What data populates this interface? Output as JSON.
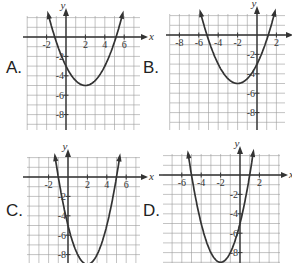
{
  "options": [
    {
      "label": "A.",
      "x_ticks": [
        "-2",
        "2",
        "4",
        "6"
      ],
      "y_ticks": [
        "-2",
        "-4",
        "-6",
        "-8"
      ],
      "equation_estimate": "y = 0.5(x-2)^2 - 5",
      "vertex": [
        2,
        -5
      ]
    },
    {
      "label": "B.",
      "x_ticks": [
        "-8",
        "-6",
        "-4",
        "-2",
        "2"
      ],
      "y_ticks": [
        "-2",
        "-4",
        "-6",
        "-8"
      ],
      "equation_estimate": "y = 0.5(x+2)^2 - 5",
      "vertex": [
        -2,
        -5
      ]
    },
    {
      "label": "C.",
      "x_ticks": [
        "-2",
        "2",
        "4",
        "6"
      ],
      "y_ticks": [
        "-2",
        "-4",
        "-6",
        "-8"
      ],
      "equation_estimate": "y = (x-2)^2 - 9",
      "vertex": [
        2,
        -9
      ]
    },
    {
      "label": "D.",
      "x_ticks": [
        "-6",
        "-4",
        "-2",
        "2"
      ],
      "y_ticks": [
        "-2",
        "-4",
        "-6",
        "-8"
      ],
      "equation_estimate": "y = (x+2)^2 - 9",
      "vertex": [
        -2,
        -9
      ]
    }
  ],
  "axis_labels": {
    "x": "x",
    "y": "y"
  },
  "chart_data": [
    {
      "type": "line",
      "title": "A",
      "xlabel": "x",
      "ylabel": "y",
      "grid": true,
      "xlim": [
        -4,
        7.5
      ],
      "ylim": [
        -9.5,
        2
      ],
      "series": [
        {
          "name": "parabola",
          "equation": "y=0.5(x-2)^2-5",
          "vertex": [
            2,
            -5
          ],
          "y_intercept": -3,
          "roots": [
            -1.16,
            5.16
          ]
        }
      ]
    },
    {
      "type": "line",
      "title": "B",
      "xlabel": "x",
      "ylabel": "y",
      "grid": true,
      "xlim": [
        -9,
        3
      ],
      "ylim": [
        -9.5,
        2
      ],
      "series": [
        {
          "name": "parabola",
          "equation": "y=0.5(x+2)^2-5",
          "vertex": [
            -2,
            -5
          ],
          "y_intercept": -3,
          "roots": [
            -5.16,
            1.16
          ]
        }
      ]
    },
    {
      "type": "line",
      "title": "C",
      "xlabel": "x",
      "ylabel": "y",
      "grid": true,
      "xlim": [
        -4,
        7.5
      ],
      "ylim": [
        -9,
        2
      ],
      "series": [
        {
          "name": "parabola",
          "equation": "y=(x-2)^2-9",
          "vertex": [
            2,
            -9
          ],
          "y_intercept": -5,
          "roots": [
            -1,
            5
          ]
        }
      ]
    },
    {
      "type": "line",
      "title": "D",
      "xlabel": "x",
      "ylabel": "y",
      "grid": true,
      "xlim": [
        -8,
        3.5
      ],
      "ylim": [
        -9,
        2
      ],
      "series": [
        {
          "name": "parabola",
          "equation": "y=(x+2)^2-9",
          "vertex": [
            -2,
            -9
          ],
          "y_intercept": -5,
          "roots": [
            -5,
            1
          ]
        }
      ]
    }
  ]
}
